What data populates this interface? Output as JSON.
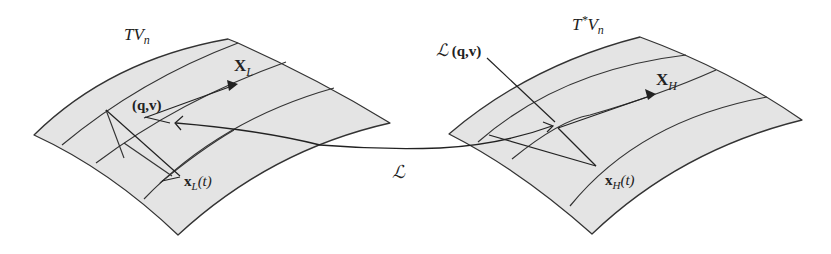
{
  "figure": {
    "colors": {
      "surface_fill": "#e4e4e4",
      "line": "#222222",
      "background": "#ffffff"
    }
  },
  "left_manifold": {
    "name": "TV",
    "subscript": "n",
    "vector_field_symbol": "X",
    "vector_field_subscript": "L",
    "point_label": "(q,v)",
    "trajectory_symbol": "x",
    "trajectory_subscript": "L",
    "trajectory_arg": "(t)"
  },
  "right_manifold": {
    "name": "T",
    "superscript": "*",
    "name_rest": "V",
    "subscript": "n",
    "vector_field_symbol": "X",
    "vector_field_subscript": "H",
    "point_map_symbol": "ℒ",
    "point_label": " (q,v)",
    "trajectory_symbol": "x",
    "trajectory_subscript": "H",
    "trajectory_arg": "(t)"
  },
  "mapping": {
    "symbol": "ℒ"
  }
}
